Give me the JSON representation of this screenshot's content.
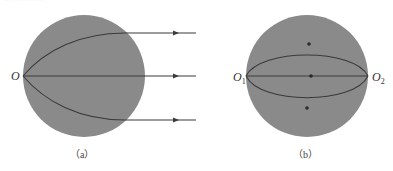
{
  "top_cropped_text": "·············",
  "colors": {
    "sphere_fill": "#8a8a8a",
    "line": "#3a3a3a",
    "background": "#ffffff"
  },
  "panel_a": {
    "caption": "（a）",
    "origin_label": "O",
    "arrows": 3
  },
  "panel_b": {
    "caption": "（b）",
    "left_label": "O",
    "left_sub": "1",
    "right_label": "O",
    "right_sub": "2",
    "markers": 3
  }
}
